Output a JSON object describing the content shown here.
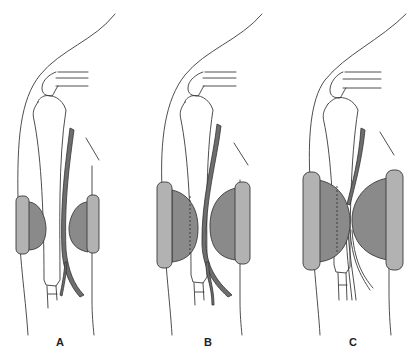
{
  "figure": {
    "type": "anatomical-illustration",
    "panels": [
      {
        "id": "A",
        "label": "A",
        "pad_size": "small",
        "dashed_overlap": false
      },
      {
        "id": "B",
        "label": "B",
        "pad_size": "medium",
        "dashed_overlap": true
      },
      {
        "id": "C",
        "label": "C",
        "pad_size": "large",
        "dashed_overlap": true
      }
    ],
    "colors": {
      "background": "#ffffff",
      "outline": "#3a3a3a",
      "cushion": "#8a8a8a",
      "plate": "#b2b2b2",
      "nerve": "#6e6e6e"
    }
  }
}
